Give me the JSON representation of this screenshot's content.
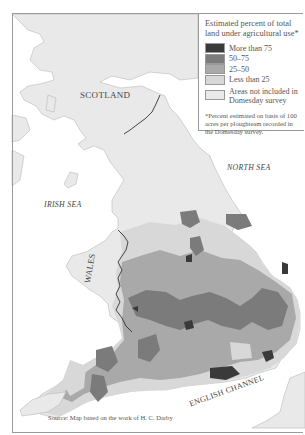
{
  "legend": {
    "title": "Estimated percent of total land under agricultural use*",
    "items": [
      {
        "label": "More than 75",
        "color": "#3a3a3a"
      },
      {
        "label": "50–75",
        "color": "#7b7b7b"
      },
      {
        "label": "25–50",
        "color": "#a9a9a9"
      },
      {
        "label": "Less than 25",
        "color": "#d8d8d8"
      },
      {
        "label": "Areas not included in Domesday survey",
        "color": "#e9e9e9"
      }
    ],
    "note": "*Percent estimated on basis of 100 acres per ploughteam recorded in the Domesday survey."
  },
  "labels": {
    "scotland": "SCOTLAND",
    "wales": "WALES",
    "irish_sea": "IRISH SEA",
    "north_sea": "NORTH SEA",
    "english_channel": "ENGLISH CHANNEL"
  },
  "source": "Source: Map based on the work of H. C. Darby",
  "colors": {
    "sea": "#ffffff",
    "land_excluded": "#e9e9e9",
    "coast": "#b9b9b9",
    "border": "#333333"
  }
}
